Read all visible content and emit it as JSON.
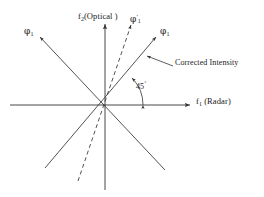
{
  "figure": {
    "name": "radar-optical-axis-diagram",
    "background_color": "#ffffff",
    "line_color": "#333333",
    "text_color": "#1a1a1a"
  },
  "axes": {
    "x": {
      "label_f": "f",
      "label_sub": "1",
      "label_paren": " (Radar)",
      "full_label": "f1 (Radar)",
      "origin_px": [
        105,
        105
      ],
      "start_px": [
        10,
        105
      ],
      "end_px": [
        192,
        105
      ],
      "arrow": "right"
    },
    "y": {
      "label_f": "f",
      "label_sub": "2",
      "label_paren": "(Optical )",
      "full_label": "f2(Optical )",
      "origin_px": [
        105,
        105
      ],
      "start_px": [
        105,
        190
      ],
      "end_px": [
        105,
        22
      ],
      "arrow": "up"
    }
  },
  "lines": [
    {
      "name": "phi1-main-diagonal",
      "style": "solid",
      "angle_deg": 45,
      "from_px": [
        45,
        168
      ],
      "to_px": [
        158,
        35
      ],
      "arrow": "end"
    },
    {
      "name": "phi1-secondary-diagonal",
      "style": "solid",
      "angle_deg": 135,
      "from_px": [
        165,
        170
      ],
      "to_px": [
        38,
        35
      ],
      "arrow": "end"
    },
    {
      "name": "phi1-prime-dashed",
      "style": "dashed",
      "angle_deg": 72,
      "from_px": [
        78,
        181
      ],
      "to_px": [
        132,
        23
      ],
      "arrow": "end"
    },
    {
      "name": "corrected-intensity-leader",
      "style": "solid",
      "from_px": [
        172,
        66
      ],
      "to_px": [
        146,
        55
      ],
      "arrow": "end"
    }
  ],
  "arc": {
    "name": "angle-arc-45",
    "center_px": [
      105,
      105
    ],
    "radius_px": 38,
    "start_deg": 0,
    "end_deg": 45,
    "arrows": "both"
  },
  "labels": {
    "y_axis": "f",
    "y_axis_sub": "2",
    "y_axis_rest": "(Optical )",
    "x_axis": "f",
    "x_axis_sub": "1",
    "x_axis_rest": " (Radar)",
    "phi_symbol": "φ",
    "phi1_right_sub": "1",
    "phi1_left_sub": "1",
    "phi1_prime_sub": "1",
    "phi1_prime_mark": "′",
    "corrected_intensity": "Corrected Intensity",
    "angle": "45",
    "angle_unit": "˚"
  }
}
